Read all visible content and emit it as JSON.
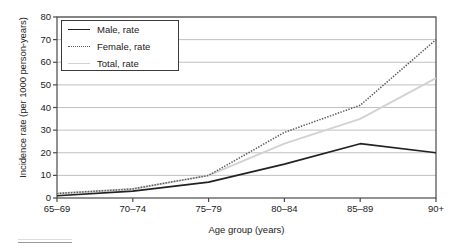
{
  "chart_data": {
    "type": "line",
    "title": "",
    "xlabel": "Age group (years)",
    "ylabel": "Incidence rate (per 1000 person-years)",
    "categories": [
      "65–69",
      "70–74",
      "75–79",
      "80–84",
      "85–89",
      "90+"
    ],
    "ylim": [
      0,
      80
    ],
    "yticks": [
      0,
      10,
      20,
      30,
      40,
      50,
      60,
      70,
      80
    ],
    "ytick_labels": [
      "0",
      "10",
      "20",
      "30",
      "40",
      "50",
      "60",
      "70",
      "80"
    ],
    "grid": "horizontal",
    "legend_position": "upper-left-inside",
    "series": [
      {
        "name": "Male, rate",
        "style": "solid",
        "color": "#222222",
        "values": [
          1,
          3,
          7,
          15,
          24,
          20
        ]
      },
      {
        "name": "Female, rate",
        "style": "dotted",
        "color": "#5a5a5a",
        "values": [
          2,
          4,
          10,
          29,
          41,
          70
        ]
      },
      {
        "name": "Total, rate",
        "style": "solid-light",
        "color": "#d2d2d2",
        "values": [
          2,
          4,
          10,
          24,
          35,
          53
        ]
      }
    ]
  },
  "axes": {
    "frame_color": "#4a4a4a",
    "gridline_color": "#b9b9b9"
  }
}
